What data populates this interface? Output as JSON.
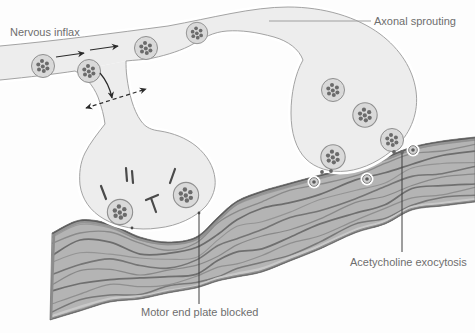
{
  "figure": {
    "type": "medical-diagram",
    "labels": {
      "nervous_inflax": "Nervous inflax",
      "axonal_sprouting": "Axonal sprouting",
      "motor_end_plate_blocked": "Motor end plate blocked",
      "acetylcholine_exocytosis": "Acetycholine exocytosis"
    },
    "counts": {
      "axon_vesicle_clusters": 4,
      "right_terminal_vesicle_clusters": 4,
      "left_terminal_vesicle_clusters": 2,
      "released_vesicles": 3,
      "blocked_receptor_marks": 5
    },
    "colors": {
      "background": "#fdfdfd",
      "neuron_fill": "#ededed",
      "neuron_outline": "#a3a3a3",
      "vesicle_fill": "#d9d9d9",
      "vesicle_outline": "#8f8f8f",
      "vesicle_dot": "#6b6b6b",
      "muscle_fill": "#b4b4b4",
      "muscle_stripe": "#6f6f6f",
      "muscle_edge": "#595959",
      "label_text": "#6e6e6e",
      "leader_dark": "#3f3f3f",
      "leader_light": "#9f9f9f",
      "arrow": "#2a2a2a"
    }
  }
}
